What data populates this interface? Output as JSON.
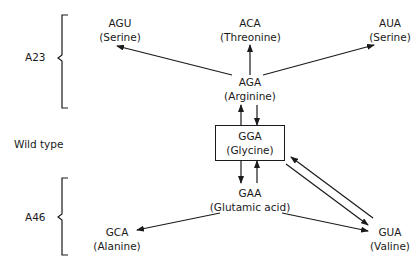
{
  "groups": {
    "a23": {
      "label": "A23"
    },
    "wild": {
      "label": "Wild type"
    },
    "a46": {
      "label": "A46"
    }
  },
  "nodes": {
    "agu": {
      "codon": "AGU",
      "amino_acid": "(Serine)"
    },
    "aca": {
      "codon": "ACA",
      "amino_acid": "(Threonine)"
    },
    "aua": {
      "codon": "AUA",
      "amino_acid": "(Serine)"
    },
    "aga": {
      "codon": "AGA",
      "amino_acid": "(Arginine)"
    },
    "gga": {
      "codon": "GGA",
      "amino_acid": "(Glycine)"
    },
    "gaa": {
      "codon": "GAA",
      "amino_acid": "(Glutamic acid)"
    },
    "gca": {
      "codon": "GCA",
      "amino_acid": "(Alanine)"
    },
    "gua": {
      "codon": "GUA",
      "amino_acid": "(Valine)"
    }
  },
  "edges": [
    {
      "from": "AGA",
      "to": "AGU"
    },
    {
      "from": "AGA",
      "to": "ACA"
    },
    {
      "from": "AGA",
      "to": "AUA"
    },
    {
      "from": "GGA",
      "to": "AGA"
    },
    {
      "from": "AGA",
      "to": "GGA"
    },
    {
      "from": "GGA",
      "to": "GAA"
    },
    {
      "from": "GAA",
      "to": "GGA"
    },
    {
      "from": "GAA",
      "to": "GCA"
    },
    {
      "from": "GAA",
      "to": "GUA"
    },
    {
      "from": "GGA",
      "to": "GUA"
    },
    {
      "from": "GUA",
      "to": "GGA"
    }
  ]
}
